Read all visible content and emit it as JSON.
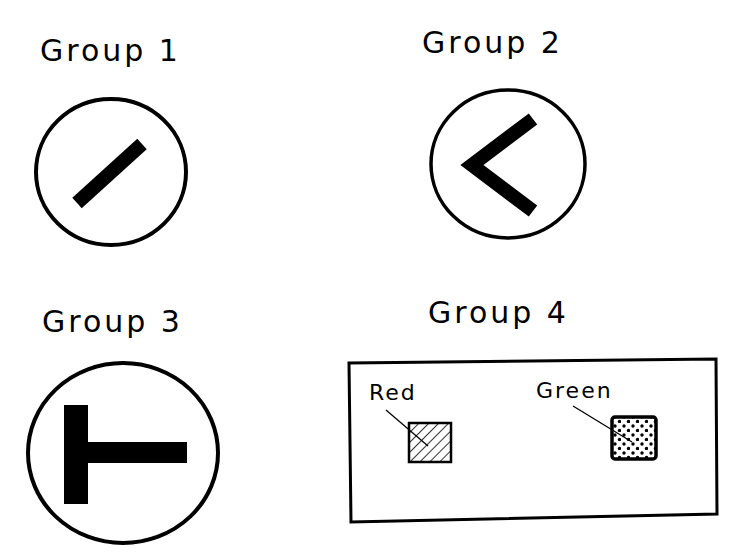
{
  "groups": [
    {
      "label": "Group 1",
      "symbol": "diagonal-slash"
    },
    {
      "label": "Group 2",
      "symbol": "left-chevron"
    },
    {
      "label": "Group 3",
      "symbol": "t-shape-rotated"
    },
    {
      "label": "Group 4",
      "symbol": "legend-box"
    }
  ],
  "legend": {
    "items": [
      {
        "label": "Red",
        "pattern": "diagonal-hatch"
      },
      {
        "label": "Green",
        "pattern": "dots"
      }
    ]
  },
  "colors": {
    "ink": "#000000",
    "background": "#ffffff"
  }
}
